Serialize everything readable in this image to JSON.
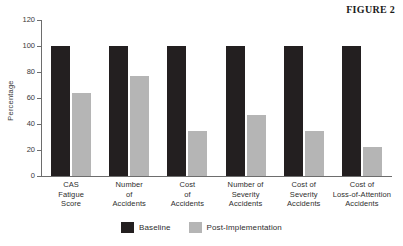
{
  "figure": {
    "title": "FIGURE 2"
  },
  "legend": {
    "items": [
      {
        "label": "Baseline",
        "color": "#231f20",
        "key": "baseline"
      },
      {
        "label": "Post-Implementation",
        "color": "#b5b5b5",
        "key": "post"
      }
    ]
  },
  "axis": {
    "y_title": "Percentage",
    "y_ticks": [
      "0",
      "20",
      "40",
      "60",
      "80",
      "100",
      "120"
    ]
  },
  "chart_data": {
    "type": "bar",
    "title": "FIGURE 2",
    "xlabel": "",
    "ylabel": "Percentage",
    "ylim": [
      0,
      120
    ],
    "ytick_values": [
      0,
      20,
      40,
      60,
      80,
      100,
      120
    ],
    "grid": false,
    "legend_position": "bottom-center",
    "categories": [
      "CAS\nFatigue\nScore",
      "Number\nof\nAccidents",
      "Cost\nof\nAccidents",
      "Number of\nSeverity\nAccidents",
      "Cost of\nSeverity\nAccidents",
      "Cost of\nLoss-of-Attention\nAccidents"
    ],
    "category_labels_flat": [
      "CAS Fatigue Score",
      "Number of Accidents",
      "Cost of Accidents",
      "Number of Severity Accidents",
      "Cost of Severity Accidents",
      "Cost of Loss-of-Attention Accidents"
    ],
    "series": [
      {
        "name": "Baseline",
        "color": "#231f20",
        "values": [
          100,
          100,
          100,
          100,
          100,
          100
        ]
      },
      {
        "name": "Post-Implementation",
        "color": "#b5b5b5",
        "values": [
          64,
          77,
          35,
          47,
          35,
          22
        ]
      }
    ]
  }
}
